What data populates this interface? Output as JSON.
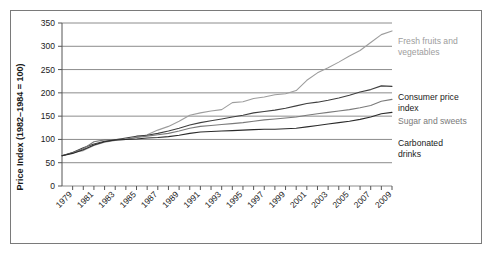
{
  "chart_data": {
    "type": "line",
    "title": "",
    "xlabel": "",
    "ylabel": "Price Index (1982–1984 = 100)",
    "ylim": [
      0,
      350
    ],
    "xlim": [
      1978,
      2009
    ],
    "grid": true,
    "legend_position": "right-inline",
    "y_ticks": [
      "0",
      "50",
      "100",
      "150",
      "200",
      "250",
      "300",
      "350"
    ],
    "y_tick_values": [
      0,
      50,
      100,
      150,
      200,
      250,
      300,
      350
    ],
    "x_ticks": [
      "1979",
      "1981",
      "1983",
      "1985",
      "1987",
      "1989",
      "1991",
      "1993",
      "1995",
      "1997",
      "1999",
      "2001",
      "2003",
      "2005",
      "2007",
      "2009"
    ],
    "x_tick_values": [
      1979,
      1981,
      1983,
      1985,
      1987,
      1989,
      1991,
      1993,
      1995,
      1997,
      1999,
      2001,
      2003,
      2005,
      2007,
      2009
    ],
    "x": [
      1978,
      1979,
      1980,
      1981,
      1982,
      1983,
      1984,
      1985,
      1986,
      1987,
      1988,
      1989,
      1990,
      1991,
      1992,
      1993,
      1994,
      1995,
      1996,
      1997,
      1998,
      1999,
      2000,
      2001,
      2002,
      2003,
      2004,
      2005,
      2006,
      2007,
      2008,
      2009
    ],
    "series": [
      {
        "name": "Fresh fruits and vegetables",
        "color": "#9d9d9d",
        "label_color": "#9d9d9d",
        "values": [
          65,
          72,
          76,
          87,
          94,
          98,
          100,
          104,
          110,
          120,
          128,
          139,
          152,
          157,
          161,
          164,
          179,
          181,
          188,
          191,
          196,
          198,
          205,
          227,
          243,
          254,
          266,
          279,
          291,
          308,
          325,
          333
        ]
      },
      {
        "name": "Consumer price index",
        "color": "#3f3f3f",
        "label_color": "#1a1a1a",
        "values": [
          65,
          72,
          82,
          90,
          96,
          99,
          103,
          107,
          109,
          113,
          118,
          124,
          131,
          136,
          140,
          144,
          148,
          152,
          157,
          160,
          163,
          167,
          172,
          177,
          180,
          184,
          189,
          195,
          202,
          207,
          215,
          214
        ]
      },
      {
        "name": "Sugar and sweets",
        "color": "#7a7a7a",
        "label_color": "#7a7a7a",
        "values": [
          65,
          71,
          80,
          95,
          99,
          100,
          101,
          104,
          107,
          110,
          113,
          118,
          124,
          128,
          130,
          132,
          134,
          136,
          139,
          142,
          144,
          146,
          148,
          152,
          155,
          158,
          161,
          164,
          168,
          173,
          182,
          186
        ]
      },
      {
        "name": "Carbonated drinks",
        "color": "#2b2b2b",
        "label_color": "#1a1a1a",
        "values": [
          65,
          70,
          78,
          88,
          95,
          99,
          100,
          101,
          103,
          104,
          106,
          109,
          113,
          116,
          117,
          118,
          119,
          120,
          121,
          122,
          122,
          123,
          124,
          127,
          130,
          133,
          136,
          139,
          143,
          148,
          155,
          158
        ]
      }
    ],
    "series_labels": [
      {
        "text_line1": "Fresh fruits and",
        "text_line2": "vegetables"
      },
      {
        "text_line1": "Consumer price",
        "text_line2": "index"
      },
      {
        "text_line1": "Sugar and sweets",
        "text_line2": ""
      },
      {
        "text_line1": "Carbonated",
        "text_line2": "drinks"
      }
    ]
  }
}
